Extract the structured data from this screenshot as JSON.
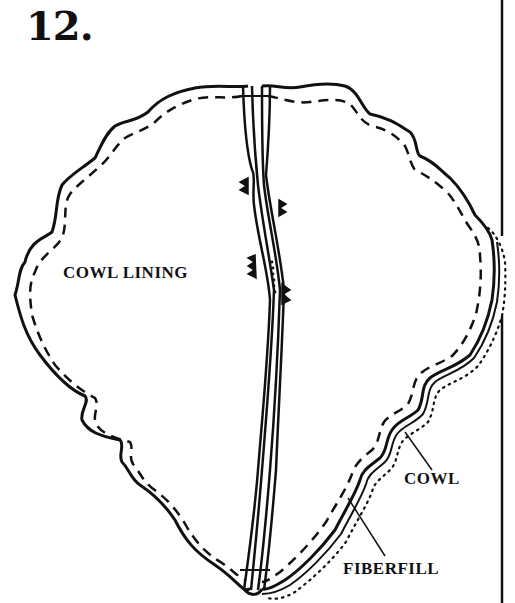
{
  "step": {
    "number": "12."
  },
  "labels": {
    "cowl_lining": "COWL LINING",
    "cowl": "COWL",
    "fiberfill": "FIBERFILL"
  },
  "colors": {
    "ink": "#111111",
    "paper": "#ffffff"
  }
}
